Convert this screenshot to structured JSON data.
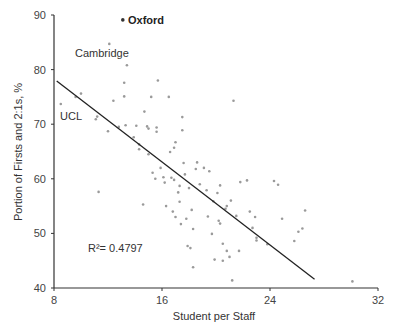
{
  "chart_data": {
    "type": "scatter",
    "title": "",
    "xlabel": "Student per Staff",
    "ylabel": "Portion of Firsts and 2:1s, %",
    "xlim": [
      8,
      32
    ],
    "ylim": [
      40,
      90
    ],
    "xticks": [
      8,
      16,
      24,
      32
    ],
    "yticks": [
      40,
      50,
      60,
      70,
      80,
      90
    ],
    "grid": false,
    "legend": null,
    "series": [
      {
        "name": "Universities",
        "points": [
          {
            "x": 13.1,
            "y": 89.1,
            "label": "Oxford"
          },
          {
            "x": 12.1,
            "y": 84.7,
            "label": "Cambridge"
          },
          {
            "x": 8.5,
            "y": 73.7,
            "label": "UCL"
          },
          {
            "x": 9.6,
            "y": 75.0
          },
          {
            "x": 10.0,
            "y": 75.6
          },
          {
            "x": 11.1,
            "y": 70.9
          },
          {
            "x": 11.2,
            "y": 71.4
          },
          {
            "x": 11.3,
            "y": 57.6
          },
          {
            "x": 12.0,
            "y": 68.7
          },
          {
            "x": 12.4,
            "y": 74.3
          },
          {
            "x": 12.8,
            "y": 69.5
          },
          {
            "x": 13.2,
            "y": 77.6
          },
          {
            "x": 13.2,
            "y": 75.1
          },
          {
            "x": 13.4,
            "y": 80.8
          },
          {
            "x": 13.3,
            "y": 69.8
          },
          {
            "x": 13.9,
            "y": 67.6
          },
          {
            "x": 14.1,
            "y": 69.7
          },
          {
            "x": 14.3,
            "y": 66.3
          },
          {
            "x": 14.3,
            "y": 65.4
          },
          {
            "x": 14.6,
            "y": 55.3
          },
          {
            "x": 14.7,
            "y": 72.3
          },
          {
            "x": 14.9,
            "y": 69.6
          },
          {
            "x": 15.0,
            "y": 69.2
          },
          {
            "x": 15.0,
            "y": 64.5
          },
          {
            "x": 15.2,
            "y": 75.0
          },
          {
            "x": 15.3,
            "y": 61.1
          },
          {
            "x": 15.5,
            "y": 60.0
          },
          {
            "x": 15.6,
            "y": 69.4
          },
          {
            "x": 15.6,
            "y": 68.6
          },
          {
            "x": 15.7,
            "y": 78.0
          },
          {
            "x": 15.9,
            "y": 62.0
          },
          {
            "x": 16.1,
            "y": 60.3
          },
          {
            "x": 16.2,
            "y": 59.3
          },
          {
            "x": 16.3,
            "y": 55.0
          },
          {
            "x": 16.5,
            "y": 75.0
          },
          {
            "x": 16.6,
            "y": 64.9
          },
          {
            "x": 16.7,
            "y": 60.2
          },
          {
            "x": 16.8,
            "y": 54.0
          },
          {
            "x": 16.9,
            "y": 59.8
          },
          {
            "x": 16.9,
            "y": 65.7
          },
          {
            "x": 17.0,
            "y": 66.7
          },
          {
            "x": 17.0,
            "y": 53.0
          },
          {
            "x": 17.2,
            "y": 57.5
          },
          {
            "x": 17.3,
            "y": 58.7
          },
          {
            "x": 17.3,
            "y": 55.8
          },
          {
            "x": 17.4,
            "y": 51.7
          },
          {
            "x": 17.5,
            "y": 71.3
          },
          {
            "x": 17.5,
            "y": 68.9
          },
          {
            "x": 17.6,
            "y": 62.9
          },
          {
            "x": 17.7,
            "y": 60.8
          },
          {
            "x": 17.8,
            "y": 52.7
          },
          {
            "x": 17.9,
            "y": 47.7
          },
          {
            "x": 18.0,
            "y": 58.3
          },
          {
            "x": 18.1,
            "y": 47.3
          },
          {
            "x": 18.2,
            "y": 54.3
          },
          {
            "x": 18.3,
            "y": 50.8
          },
          {
            "x": 18.3,
            "y": 43.8
          },
          {
            "x": 18.5,
            "y": 61.8
          },
          {
            "x": 18.6,
            "y": 63.0
          },
          {
            "x": 18.8,
            "y": 59.0
          },
          {
            "x": 19.1,
            "y": 62.0
          },
          {
            "x": 19.3,
            "y": 57.9
          },
          {
            "x": 19.4,
            "y": 53.1
          },
          {
            "x": 19.5,
            "y": 61.4
          },
          {
            "x": 19.7,
            "y": 49.9
          },
          {
            "x": 19.8,
            "y": 55.9
          },
          {
            "x": 19.9,
            "y": 45.2
          },
          {
            "x": 20.1,
            "y": 57.4
          },
          {
            "x": 20.2,
            "y": 52.3
          },
          {
            "x": 20.3,
            "y": 58.8
          },
          {
            "x": 20.3,
            "y": 51.8
          },
          {
            "x": 20.5,
            "y": 48.1
          },
          {
            "x": 20.5,
            "y": 45.0
          },
          {
            "x": 20.7,
            "y": 54.5
          },
          {
            "x": 20.8,
            "y": 55.0
          },
          {
            "x": 20.8,
            "y": 46.8
          },
          {
            "x": 21.0,
            "y": 45.7
          },
          {
            "x": 21.1,
            "y": 56.0
          },
          {
            "x": 21.2,
            "y": 41.4
          },
          {
            "x": 21.3,
            "y": 74.3
          },
          {
            "x": 21.5,
            "y": 53.2
          },
          {
            "x": 21.7,
            "y": 46.8
          },
          {
            "x": 21.8,
            "y": 59.4
          },
          {
            "x": 22.3,
            "y": 59.7
          },
          {
            "x": 22.5,
            "y": 54.0
          },
          {
            "x": 22.7,
            "y": 51.0
          },
          {
            "x": 22.9,
            "y": 53.0
          },
          {
            "x": 23.0,
            "y": 49.2
          },
          {
            "x": 23.0,
            "y": 48.7
          },
          {
            "x": 23.8,
            "y": 48.0
          },
          {
            "x": 24.3,
            "y": 59.6
          },
          {
            "x": 24.6,
            "y": 58.9
          },
          {
            "x": 24.9,
            "y": 52.7
          },
          {
            "x": 25.8,
            "y": 48.6
          },
          {
            "x": 26.1,
            "y": 50.3
          },
          {
            "x": 26.4,
            "y": 50.9
          },
          {
            "x": 26.6,
            "y": 54.2
          },
          {
            "x": 30.1,
            "y": 41.2
          }
        ]
      }
    ],
    "trendline": {
      "type": "linear",
      "from": {
        "x": 8.2,
        "y": 77.9
      },
      "to": {
        "x": 27.3,
        "y": 41.6
      }
    },
    "annotations": [
      {
        "text": "Oxford",
        "bold": true
      },
      {
        "text": "Cambridge"
      },
      {
        "text": "UCL"
      },
      {
        "text": "R²= 0.4797"
      }
    ]
  },
  "labels": {
    "oxford": "Oxford",
    "cambridge": "Cambridge",
    "ucl": "UCL",
    "r_squared": "R²= 0.4797",
    "xlabel": "Student per Staff",
    "ylabel": "Portion of Firsts and 2:1s, %",
    "xticks": [
      "8",
      "16",
      "24",
      "32"
    ],
    "yticks": [
      "40",
      "50",
      "60",
      "70",
      "80",
      "90"
    ]
  },
  "colors": {
    "axis": "#333333",
    "point": "#9a9a9a",
    "trendline": "#222222",
    "text": "#333333"
  }
}
